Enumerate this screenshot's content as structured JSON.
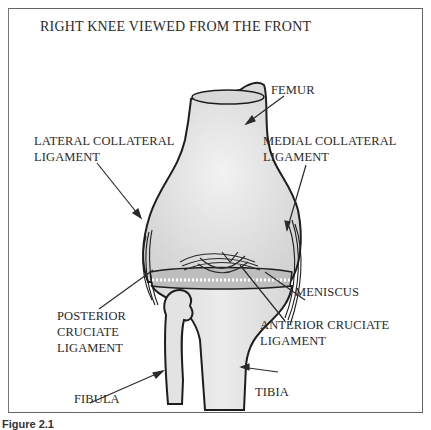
{
  "title": "RIGHT KNEE VIEWED FROM THE FRONT",
  "labels": {
    "femur": "FEMUR",
    "lateral_collateral_1": "LATERAL COLLATERAL",
    "lateral_collateral_2": "LIGAMENT",
    "medial_collateral_1": "MEDIAL COLLATERAL",
    "medial_collateral_2": "LIGAMENT",
    "meniscus": "MENISCUS",
    "posterior_cruciate_1": "POSTERIOR",
    "posterior_cruciate_2": "CRUCIATE",
    "posterior_cruciate_3": "LIGAMENT",
    "anterior_cruciate_1": "ANTERIOR CRUCIATE",
    "anterior_cruciate_2": "LIGAMENT",
    "fibula": "FIBULA",
    "tibia": "TIBIA"
  },
  "caption": "Figure 2.1",
  "colors": {
    "bone_fill": "#e6e6e6",
    "outline": "#1e1e1e",
    "frame": "#666666"
  }
}
